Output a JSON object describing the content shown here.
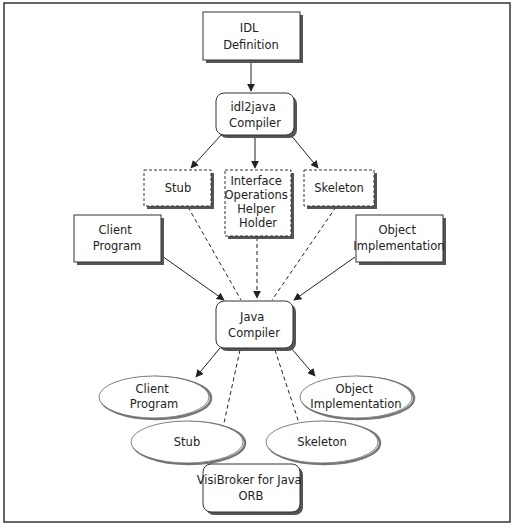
{
  "colors": {
    "stroke": "#333333",
    "shadow": "#555555",
    "fill": "#ffffff",
    "ellipse_stroke": "#666666",
    "ellipse_shadow": "#777777",
    "frame": "#333333"
  },
  "nodes": {
    "idl_definition": {
      "lines": [
        "IDL",
        "Definition"
      ],
      "shape": "rect"
    },
    "idl2java_compiler": {
      "lines": [
        "idl2java",
        "Compiler"
      ],
      "shape": "rounded-rect"
    },
    "stub_gen": {
      "lines": [
        "Stub"
      ],
      "shape": "dashed-rect"
    },
    "interface_gen": {
      "lines": [
        "Interface",
        "Operations",
        "Helper",
        "Holder"
      ],
      "shape": "dashed-rect"
    },
    "skeleton_gen": {
      "lines": [
        "Skeleton"
      ],
      "shape": "dashed-rect"
    },
    "client_program_src": {
      "lines": [
        "Client",
        "Program"
      ],
      "shape": "rect"
    },
    "object_impl_src": {
      "lines": [
        "Object",
        "Implementation"
      ],
      "shape": "rect"
    },
    "java_compiler": {
      "lines": [
        "Java",
        "Compiler"
      ],
      "shape": "rounded-rect"
    },
    "client_program_out": {
      "lines": [
        "Client",
        "Program"
      ],
      "shape": "ellipse"
    },
    "object_impl_out": {
      "lines": [
        "Object",
        "Implementation"
      ],
      "shape": "ellipse"
    },
    "stub_out": {
      "lines": [
        "Stub"
      ],
      "shape": "ellipse"
    },
    "skeleton_out": {
      "lines": [
        "Skeleton"
      ],
      "shape": "ellipse"
    },
    "orb": {
      "lines": [
        "VisiBroker for Java",
        "ORB"
      ],
      "shape": "rounded-rect"
    }
  },
  "edges": [
    {
      "from": "idl_definition",
      "to": "idl2java_compiler",
      "style": "solid-arrow"
    },
    {
      "from": "idl2java_compiler",
      "to": "stub_gen",
      "style": "solid-arrow"
    },
    {
      "from": "idl2java_compiler",
      "to": "interface_gen",
      "style": "solid-arrow"
    },
    {
      "from": "idl2java_compiler",
      "to": "skeleton_gen",
      "style": "solid-arrow"
    },
    {
      "from": "stub_gen",
      "to": "java_compiler",
      "style": "dashed"
    },
    {
      "from": "interface_gen",
      "to": "java_compiler",
      "style": "dashed-arrow"
    },
    {
      "from": "skeleton_gen",
      "to": "java_compiler",
      "style": "dashed"
    },
    {
      "from": "client_program_src",
      "to": "java_compiler",
      "style": "solid-arrow"
    },
    {
      "from": "object_impl_src",
      "to": "java_compiler",
      "style": "solid-arrow"
    },
    {
      "from": "java_compiler",
      "to": "client_program_out",
      "style": "solid-arrow"
    },
    {
      "from": "java_compiler",
      "to": "object_impl_out",
      "style": "solid-arrow"
    },
    {
      "from": "java_compiler",
      "to": "stub_out",
      "style": "dashed"
    },
    {
      "from": "java_compiler",
      "to": "skeleton_out",
      "style": "dashed"
    }
  ]
}
